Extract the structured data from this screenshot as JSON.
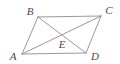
{
  "figure": {
    "background_color": "#ffffff",
    "stroke_color": "#8c8c8c",
    "label_color": "#4a4a4a",
    "stroke_width": 0.9,
    "viewbox": "0 0 120 64",
    "labels": {
      "a": "A",
      "b": "B",
      "c": "C",
      "d": "D",
      "e": "E"
    },
    "label_positions": {
      "a": {
        "x": 13,
        "y": 56
      },
      "b": {
        "x": 30,
        "y": 11
      },
      "c": {
        "x": 109,
        "y": 10
      },
      "d": {
        "x": 95,
        "y": 56
      },
      "e": {
        "x": 62,
        "y": 44
      }
    },
    "vertices": {
      "a": {
        "x": 22,
        "y": 54
      },
      "b": {
        "x": 38,
        "y": 17
      },
      "c": {
        "x": 101,
        "y": 16
      },
      "d": {
        "x": 86,
        "y": 53
      },
      "e": {
        "x": 62,
        "y": 34
      }
    },
    "segments": [
      {
        "name": "side-ab",
        "from": "a",
        "to": "b"
      },
      {
        "name": "side-bc",
        "from": "b",
        "to": "c"
      },
      {
        "name": "side-cd",
        "from": "c",
        "to": "d"
      },
      {
        "name": "side-da",
        "from": "d",
        "to": "a"
      },
      {
        "name": "diagonal-ac",
        "from": "a",
        "to": "c"
      },
      {
        "name": "diagonal-bd",
        "from": "b",
        "to": "d"
      }
    ]
  }
}
